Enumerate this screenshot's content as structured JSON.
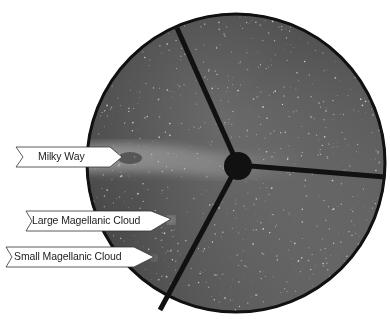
{
  "figure": {
    "colors": {
      "sky_dark": "#2a2a2a",
      "sky_light": "#7a7a7a",
      "rim": "#111111",
      "label_bg": "#ffffff",
      "label_border": "#333333"
    }
  },
  "labels": [
    {
      "id": "milky-way",
      "text": "Milky Way"
    },
    {
      "id": "lmc",
      "text": "Large Magellanic Cloud"
    },
    {
      "id": "smc",
      "text": "Small Magellanic Cloud"
    }
  ]
}
